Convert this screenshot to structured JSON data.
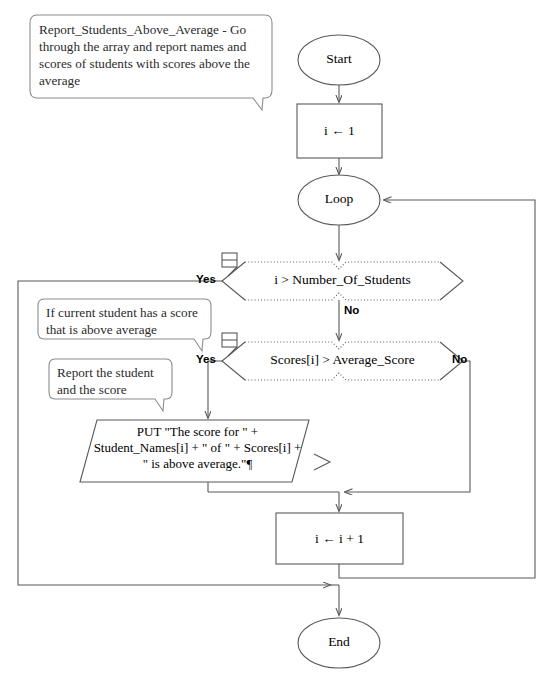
{
  "diagram": {
    "type": "flowchart",
    "title": "Report_Students_Above_Average",
    "comments": [
      {
        "id": "comment-procedure",
        "text": "Report_Students_Above_Average - Go through the array and report names and scores of students with scores above the average"
      },
      {
        "id": "comment-condition",
        "text": "If current student has a score that is above average"
      },
      {
        "id": "comment-output",
        "text": "Report the student and the score"
      }
    ],
    "nodes": {
      "start": {
        "label": "Start",
        "shape": "terminator"
      },
      "init": {
        "label": "i ← 1",
        "shape": "process"
      },
      "loop": {
        "label": "Loop",
        "shape": "terminator"
      },
      "decision_bounds": {
        "label": "i > Number_Of_Students",
        "shape": "decision"
      },
      "decision_score": {
        "label": "Scores[i] > Average_Score",
        "shape": "decision"
      },
      "output": {
        "label": "PUT \"The score for \" + Student_Names[i] + \" of \" + Scores[i] + \" is above average.\"¶",
        "shape": "output-parallelogram"
      },
      "increment": {
        "label": "i ← i + 1",
        "shape": "process"
      },
      "end": {
        "label": "End",
        "shape": "terminator"
      }
    },
    "branch_labels": {
      "bounds_yes": "Yes",
      "bounds_no": "No",
      "score_yes": "Yes",
      "score_no": "No"
    },
    "icons": {
      "bounds_note": "note-icon",
      "score_note": "note-icon",
      "output_marker": "arrow-right-icon"
    },
    "colors": {
      "stroke": "#595959",
      "text": "#000000",
      "comment_stroke": "#8c8c8c",
      "background": "#ffffff"
    }
  }
}
